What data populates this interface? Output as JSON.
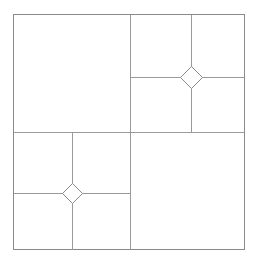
{
  "document": {
    "title": "Dad's Bow Tie",
    "background_color": "#ffffff"
  },
  "diagram": {
    "name": "quilt-block-diagram",
    "type": "quilt-block-layout",
    "line_color": "#9a9a9a",
    "line_color_dark": "#8a8a8a",
    "fill_color": "#ffffff",
    "line_width": 1,
    "frame": {
      "x": 13,
      "y": 14,
      "width": 232,
      "height": 236
    },
    "center_divider": {
      "vertical_x": 130,
      "horizontal_y": 132
    },
    "quadrants": [
      {
        "name": "upper-left",
        "pattern": "plain",
        "x": 13,
        "y": 14,
        "width": 117,
        "height": 118
      },
      {
        "name": "upper-right",
        "pattern": "bow-tie",
        "x": 130,
        "y": 14,
        "width": 115,
        "height": 118,
        "cross_x": 191,
        "cross_y": 77,
        "diamond_center_x": 191,
        "diamond_center_y": 77,
        "diamond_radius": 11
      },
      {
        "name": "lower-left",
        "pattern": "bow-tie",
        "x": 13,
        "y": 132,
        "width": 117,
        "height": 118,
        "cross_x": 72,
        "cross_y": 193,
        "diamond_center_x": 72,
        "diamond_center_y": 193,
        "diamond_radius": 10
      },
      {
        "name": "lower-right",
        "pattern": "plain",
        "x": 130,
        "y": 132,
        "width": 115,
        "height": 118
      }
    ]
  }
}
